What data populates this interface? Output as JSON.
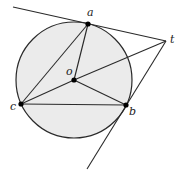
{
  "diagram": {
    "title": "",
    "colors": {
      "circle_fill": "#ebebeb",
      "stroke": "#2a2a2a",
      "point": "#000000",
      "background": "#ffffff"
    },
    "circle": {
      "cx": 74,
      "cy": 80,
      "r": 58
    },
    "points": {
      "a": {
        "label": "a",
        "x": 88,
        "y": 24,
        "label_x": 87,
        "label_y": 16
      },
      "o": {
        "label": "o",
        "x": 74,
        "y": 80,
        "label_x": 66,
        "label_y": 75
      },
      "c": {
        "label": "c",
        "x": 21,
        "y": 104,
        "label_x": 10,
        "label_y": 110
      },
      "b": {
        "label": "b",
        "x": 126,
        "y": 105,
        "label_x": 129,
        "label_y": 115
      },
      "t": {
        "label": "t",
        "x": 166,
        "y": 41,
        "label_x": 170,
        "label_y": 43
      }
    },
    "segments": [
      {
        "name": "tangent-line-at-a",
        "from": [
          13,
          7
        ],
        "to": [
          166,
          41
        ]
      },
      {
        "name": "tangent-line-at-b",
        "from": [
          166,
          41
        ],
        "to": [
          87,
          169
        ]
      },
      {
        "name": "segment-to",
        "from": [
          166,
          41
        ],
        "to": [
          74,
          80
        ]
      },
      {
        "name": "segment-ac",
        "from": [
          88,
          24
        ],
        "to": [
          21,
          104
        ]
      },
      {
        "name": "segment-ao",
        "from": [
          88,
          24
        ],
        "to": [
          74,
          80
        ]
      },
      {
        "name": "segment-oc",
        "from": [
          74,
          80
        ],
        "to": [
          21,
          104
        ]
      },
      {
        "name": "segment-ob",
        "from": [
          74,
          80
        ],
        "to": [
          126,
          105
        ]
      },
      {
        "name": "segment-cb",
        "from": [
          21,
          104
        ],
        "to": [
          126,
          105
        ]
      }
    ]
  }
}
